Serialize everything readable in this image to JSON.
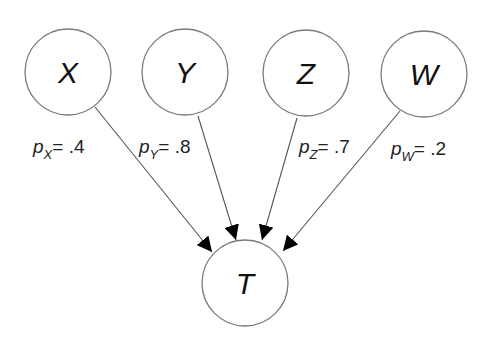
{
  "diagram": {
    "title": "",
    "nodes": [
      {
        "id": "X",
        "label": "X",
        "cx": 68,
        "cy": 72,
        "r": 43
      },
      {
        "id": "Y",
        "label": "Y",
        "cx": 185,
        "cy": 72,
        "r": 43
      },
      {
        "id": "Z",
        "label": "Z",
        "cx": 306,
        "cy": 73,
        "r": 43
      },
      {
        "id": "W",
        "label": "W",
        "cx": 424,
        "cy": 74,
        "r": 43
      },
      {
        "id": "T",
        "label": "T",
        "cx": 245,
        "cy": 283,
        "r": 43
      }
    ],
    "edges": [
      {
        "from": "X",
        "to": "T",
        "x1": 95,
        "y1": 107,
        "x2": 212,
        "y2": 252
      },
      {
        "from": "Y",
        "to": "T",
        "x1": 198,
        "y1": 116,
        "x2": 236,
        "y2": 240
      },
      {
        "from": "Z",
        "to": "T",
        "x1": 297,
        "y1": 118,
        "x2": 262,
        "y2": 240
      },
      {
        "from": "W",
        "to": "T",
        "x1": 400,
        "y1": 111,
        "x2": 283,
        "y2": 251
      }
    ],
    "probabilities": [
      {
        "node": "X",
        "symbol": "p",
        "subscript": "X",
        "equals": "=",
        "value": ".4",
        "x": 33,
        "y": 153
      },
      {
        "node": "Y",
        "symbol": "p",
        "subscript": "Y",
        "equals": "=",
        "value": ".8",
        "x": 139,
        "y": 153
      },
      {
        "node": "Z",
        "symbol": "p",
        "subscript": "Z",
        "equals": "=",
        "value": ".7",
        "x": 299,
        "y": 153
      },
      {
        "node": "W",
        "symbol": "p",
        "subscript": "W",
        "equals": "=",
        "value": ".2",
        "x": 391,
        "y": 155
      }
    ],
    "colors": {
      "node_stroke": "#7a7a7a",
      "edge_stroke": "#555555",
      "arrowhead": "#000000",
      "text": "#111111",
      "background": "#ffffff"
    }
  }
}
